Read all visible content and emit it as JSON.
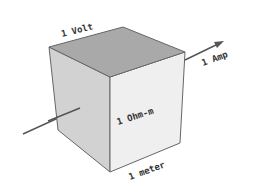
{
  "diagram": {
    "labels": {
      "top_edge": "1 Volt",
      "current": "1 Amp",
      "front_face": "1 Ohm-m",
      "bottom_edge": "1 meter"
    },
    "colors": {
      "top_face": "#a9a9a9",
      "left_face": "#d2d2d2",
      "front_face": "#efefef",
      "edge": "#666666",
      "arrow": "#555555"
    }
  }
}
